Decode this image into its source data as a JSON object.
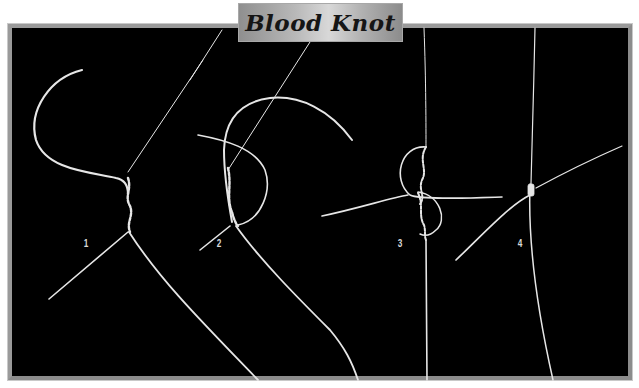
{
  "title": "Blood Knot",
  "steps": [
    {
      "label": "1"
    },
    {
      "label": "2"
    },
    {
      "label": "3"
    },
    {
      "label": "4"
    }
  ],
  "colors": {
    "background": "#000000",
    "line": "#e6e6e6",
    "frame": "#9a9a9a",
    "banner": "#b9b9b9",
    "title_text": "#151515"
  }
}
